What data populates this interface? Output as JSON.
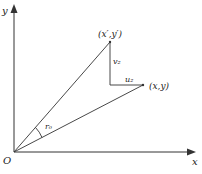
{
  "diagram": {
    "axes": {
      "x_label": "x",
      "y_label": "y",
      "origin_label": "O"
    },
    "points": {
      "rotated": {
        "label": "(x′,y′)"
      },
      "original": {
        "label": "(x,y)"
      }
    },
    "segments": {
      "vertical_label": "v₂",
      "horizontal_label": "u₂"
    },
    "angle_label": "r₀",
    "colors": {
      "line": "#333333",
      "background": "#ffffff"
    }
  }
}
